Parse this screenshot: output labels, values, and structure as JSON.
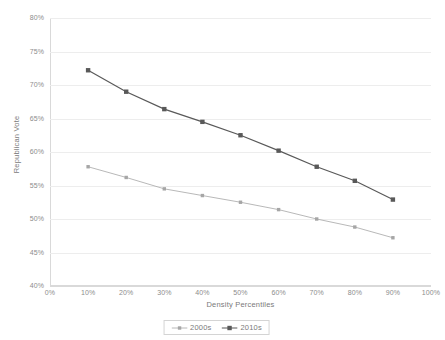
{
  "chart_data": {
    "type": "line",
    "title": "",
    "xlabel": "Density Percentiles",
    "ylabel": "Republican Vote",
    "x": [
      10,
      20,
      30,
      40,
      50,
      60,
      70,
      80,
      90
    ],
    "xtick_labels": [
      "0%",
      "10%",
      "20%",
      "30%",
      "40%",
      "50%",
      "60%",
      "70%",
      "80%",
      "90%",
      "100%"
    ],
    "xtick_values": [
      0,
      10,
      20,
      30,
      40,
      50,
      60,
      70,
      80,
      90,
      100
    ],
    "ytick_labels": [
      "40%",
      "45%",
      "50%",
      "55%",
      "60%",
      "65%",
      "70%",
      "75%",
      "80%"
    ],
    "ytick_values": [
      40,
      45,
      50,
      55,
      60,
      65,
      70,
      75,
      80
    ],
    "xlim": [
      0,
      100
    ],
    "ylim": [
      40,
      80
    ],
    "grid": "horizontal",
    "legend_position": "bottom",
    "series": [
      {
        "name": "2000s",
        "color": "#a6a6a6",
        "values": [
          57.8,
          56.2,
          54.5,
          53.5,
          52.5,
          51.4,
          50.0,
          48.8,
          47.2
        ]
      },
      {
        "name": "2010s",
        "color": "#595959",
        "values": [
          72.2,
          69.0,
          66.4,
          64.5,
          62.5,
          60.2,
          57.8,
          55.7,
          52.9
        ]
      }
    ]
  },
  "colors": {
    "background": "#ffffff",
    "gridline": "#ededed",
    "axis": "#d9d9d9",
    "text": "#8c8c8c",
    "series_2000s": "#a6a6a6",
    "series_2010s": "#595959"
  }
}
